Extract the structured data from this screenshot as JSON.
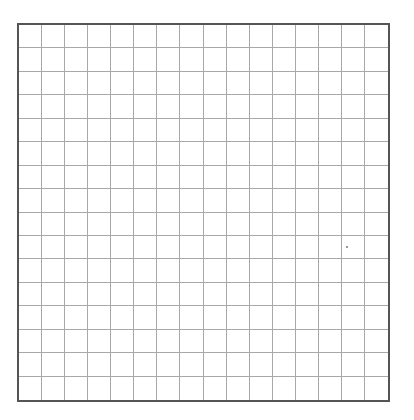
{
  "grid": {
    "columns": 16,
    "rows": 16,
    "border_color": "#555555",
    "line_color": "#a8a8a8",
    "background": "#ffffff"
  }
}
